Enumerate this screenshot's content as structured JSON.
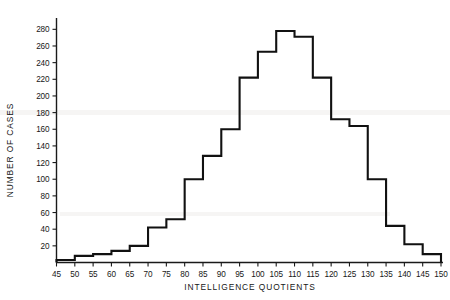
{
  "chart_data": {
    "type": "bar",
    "title": "",
    "subtitle": "",
    "xlabel": "INTELLIGENCE QUOTIENTS",
    "ylabel": "NUMBER OF CASES",
    "xlim": [
      45,
      150
    ],
    "ylim": [
      0,
      290
    ],
    "grid": false,
    "legend": false,
    "bin_width": 5,
    "xticks": [
      45,
      50,
      55,
      60,
      65,
      70,
      75,
      80,
      85,
      90,
      95,
      100,
      105,
      110,
      115,
      120,
      125,
      130,
      135,
      140,
      145,
      150
    ],
    "xtick_labels": [
      "45",
      "50",
      "55",
      "60",
      "65",
      "70",
      "75",
      "80",
      "85",
      "90",
      "95",
      "100",
      "105",
      "110",
      "115",
      "120",
      "125",
      "130",
      "135",
      "140",
      "145",
      "150"
    ],
    "yticks": [
      20,
      40,
      60,
      80,
      100,
      120,
      140,
      160,
      180,
      200,
      220,
      240,
      260,
      280
    ],
    "ytick_labels": [
      "20",
      "40",
      "60",
      "80",
      "100",
      "120",
      "140",
      "160",
      "180",
      "200",
      "220",
      "240",
      "260",
      "280"
    ],
    "bin_edges": [
      45,
      50,
      55,
      60,
      65,
      70,
      75,
      80,
      85,
      90,
      95,
      100,
      105,
      110,
      115,
      120,
      125,
      130,
      135,
      140,
      145,
      150
    ],
    "categories": [
      "45-50",
      "50-55",
      "55-60",
      "60-65",
      "65-70",
      "70-75",
      "75-80",
      "80-85",
      "85-90",
      "90-95",
      "95-100",
      "100-105",
      "105-110",
      "110-115",
      "115-120",
      "120-125",
      "125-130",
      "130-135",
      "135-140",
      "140-145",
      "145-150"
    ],
    "values": [
      3,
      8,
      10,
      14,
      20,
      42,
      52,
      100,
      128,
      160,
      222,
      253,
      278,
      271,
      222,
      172,
      164,
      100,
      44,
      22,
      10
    ]
  },
  "axes": {
    "y_label": "NUMBER OF CASES",
    "x_label": "INTELLIGENCE QUOTIENTS"
  },
  "colors": {
    "line": "#111111",
    "axis": "#1a1a1a",
    "background": "#ffffff",
    "text": "#171717"
  }
}
